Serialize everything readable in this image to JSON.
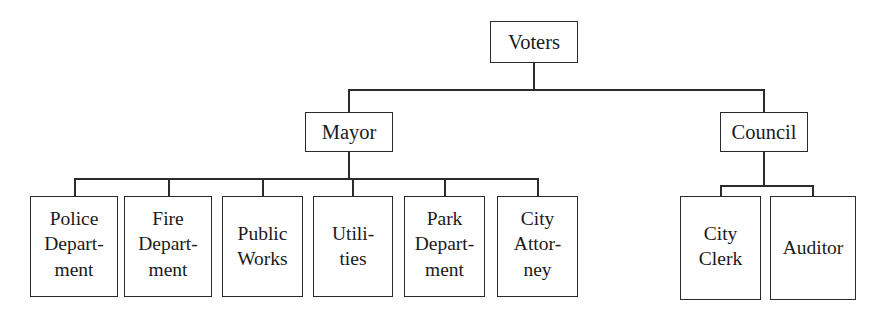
{
  "chart": {
    "type": "org-chart",
    "background_color": "#ffffff",
    "line_color": "#2b2b2b",
    "text_color": "#1a1a1a"
  },
  "nodes": {
    "voters": {
      "label": "Voters",
      "level": 0
    },
    "mayor": {
      "label": "Mayor",
      "level": 1
    },
    "council": {
      "label": "Council",
      "level": 1
    },
    "police": {
      "label": "Police\nDepart-\nment",
      "level": 2
    },
    "fire": {
      "label": "Fire\nDepart-\nment",
      "level": 2
    },
    "public_works": {
      "label": "Public\nWorks",
      "level": 2
    },
    "utilities": {
      "label": "Utili-\nties",
      "level": 2
    },
    "park": {
      "label": "Park\nDepart-\nment",
      "level": 2
    },
    "city_attorney": {
      "label": "City\nAttor-\nney",
      "level": 2
    },
    "city_clerk": {
      "label": "City\nClerk",
      "level": 2
    },
    "auditor": {
      "label": "Auditor",
      "level": 2
    }
  },
  "hierarchy": {
    "root": "voters",
    "edges": [
      {
        "from": "voters",
        "to": "mayor"
      },
      {
        "from": "voters",
        "to": "council"
      },
      {
        "from": "mayor",
        "to": "police"
      },
      {
        "from": "mayor",
        "to": "fire"
      },
      {
        "from": "mayor",
        "to": "public_works"
      },
      {
        "from": "mayor",
        "to": "utilities"
      },
      {
        "from": "mayor",
        "to": "park"
      },
      {
        "from": "mayor",
        "to": "city_attorney"
      },
      {
        "from": "council",
        "to": "city_clerk"
      },
      {
        "from": "council",
        "to": "auditor"
      }
    ]
  }
}
